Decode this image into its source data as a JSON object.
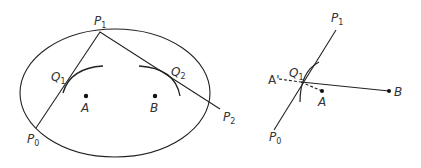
{
  "figure": {
    "left_panel": {
      "labels": {
        "P1": {
          "base": "P",
          "sub": "1"
        },
        "P0": {
          "base": "P",
          "sub": "0"
        },
        "P2": {
          "base": "P",
          "sub": "2"
        },
        "Q1": {
          "base": "Q",
          "sub": "1"
        },
        "Q2": {
          "base": "Q",
          "sub": "2"
        },
        "A": "A",
        "B": "B"
      }
    },
    "right_panel": {
      "labels": {
        "P1": {
          "base": "P",
          "sub": "1"
        },
        "P0": {
          "base": "P",
          "sub": "0"
        },
        "Q1": {
          "base": "Q",
          "sub": "1"
        },
        "A_prime": "A'",
        "A": "A",
        "B": "B"
      }
    },
    "colors": {
      "stroke": "#222222",
      "text": "#333333",
      "background": "#ffffff"
    }
  }
}
